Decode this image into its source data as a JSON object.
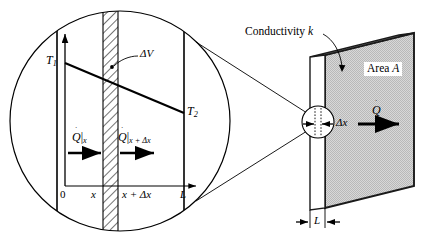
{
  "figure": {
    "domain": "diagram",
    "background": "#ffffff",
    "line_color": "#000000",
    "slab_face_color": "#c8c8c8",
    "slab_edge_color": "#1a1a1a"
  },
  "magnifier": {
    "name": "magnified-inset-circle",
    "axis": {
      "x_axis_label": "x-axis-arrow",
      "y_axis_label": "T-axis-arrow"
    },
    "labels": {
      "T1": "T",
      "T1_sub": "1",
      "T2": "T",
      "T2_sub": "2",
      "delta_v": "ΔV",
      "flux_left_symbol": "Q",
      "flux_left_sub": "x",
      "flux_right_symbol": "Q",
      "flux_right_sub": "x + Δx",
      "flux_bar": "|",
      "dot_accent": "˙"
    },
    "ticks": {
      "origin": "0",
      "x": "x",
      "x_plus_dx": "x + Δx",
      "L": "L"
    }
  },
  "slab": {
    "name": "plane-slab-3d",
    "conductivity_label": "Conductivity k",
    "conductivity_symbol": "k",
    "conductivity_text": "Conductivity",
    "area_text": "Area",
    "area_symbol": "A",
    "heat_flow_symbol": "Q",
    "heat_flow_dot": "˙",
    "thickness_label": "L",
    "element_thickness_label": "Δx"
  }
}
